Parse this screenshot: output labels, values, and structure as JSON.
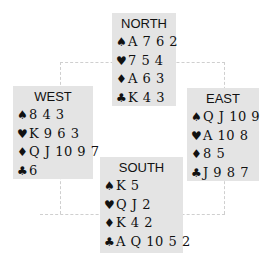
{
  "hands": {
    "north": {
      "seat": "NORTH",
      "spades": "A 7 6 2",
      "hearts": "7 5 4",
      "diamonds": "A 6 3",
      "clubs": "K 4 3"
    },
    "west": {
      "seat": "WEST",
      "spades": "8 4 3",
      "hearts": "K 9 6 3",
      "diamonds": "Q J 10 9 7",
      "clubs": "6"
    },
    "east": {
      "seat": "EAST",
      "spades": "Q J 10 9",
      "hearts": "A 10 8",
      "diamonds": "8 5",
      "clubs": "J 9 8 7"
    },
    "south": {
      "seat": "SOUTH",
      "spades": "K 5",
      "hearts": "Q J 2",
      "diamonds": "K 4 2",
      "clubs": "A Q 10 5 2"
    }
  },
  "suits": {
    "spades": "♠",
    "hearts": "♥",
    "diamonds": "♦",
    "clubs": "♣"
  },
  "colors": {
    "box_bg": "#e4e4e4",
    "text": "#111111",
    "dash": "#cfcfcf"
  }
}
